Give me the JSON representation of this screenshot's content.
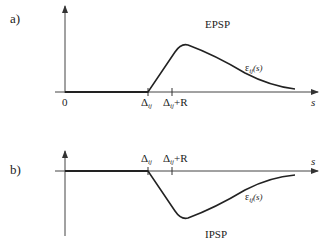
{
  "panels": {
    "a": {
      "label": "a)",
      "title": "EPSP",
      "function_label": "ε",
      "function_sub": "ij",
      "function_arg": "(s)",
      "origin_label": "0",
      "delta_label": "Δ",
      "delta_sub": "ij",
      "delta_r_label": "Δ",
      "delta_r_sub": "ij",
      "delta_r_suffix": "+R",
      "axis_label": "s"
    },
    "b": {
      "label": "b)",
      "title": "IPSP",
      "function_label": "ε",
      "function_sub": "ij",
      "function_arg": "(s)",
      "delta_label": "Δ",
      "delta_sub": "ij",
      "delta_r_label": "Δ",
      "delta_r_sub": "ij",
      "delta_r_suffix": "+R",
      "axis_label": "s"
    }
  },
  "colors": {
    "ink": "#222222",
    "background": "#ffffff"
  }
}
